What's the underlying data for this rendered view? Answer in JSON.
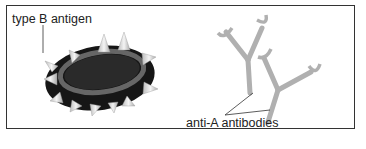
{
  "diagram": {
    "labels": {
      "antigen": "type B antigen",
      "antibodies": "anti-A antibodies"
    },
    "colors": {
      "cell_body": "#1c1c1c",
      "cell_halo": "#6a6a6a",
      "spike": "#e6e6e6",
      "antibody": "#b4b4b4",
      "border": "#333333",
      "text": "#222222"
    }
  }
}
